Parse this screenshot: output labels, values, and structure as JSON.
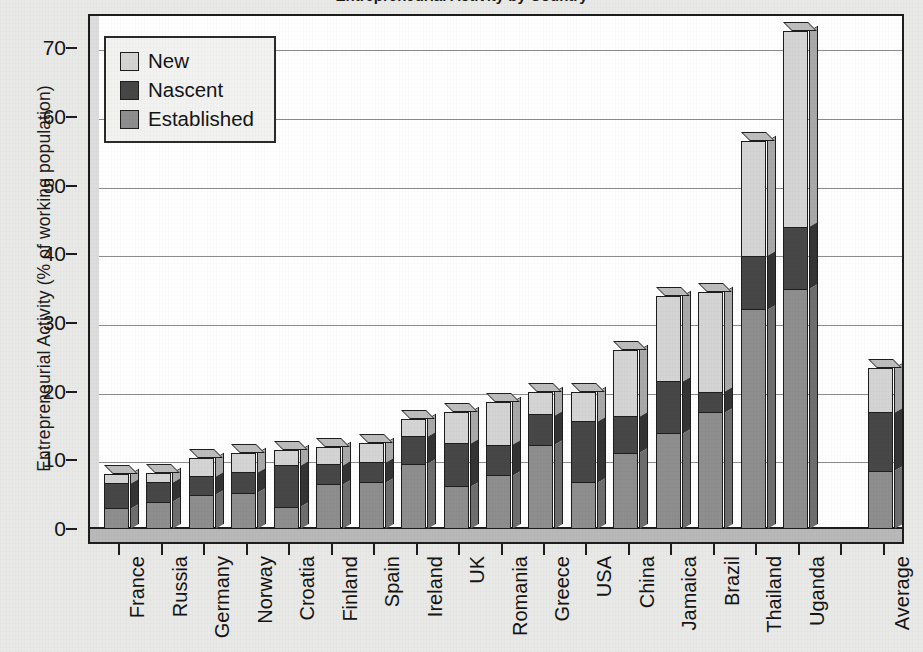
{
  "chart": {
    "title": "Entrepreneurial Activity by Country",
    "y_axis_title": "Entrepreneurial Activity (% of working population)"
  },
  "legend": {
    "items": [
      {
        "label": "New",
        "swatch": "new",
        "color": "#d4d4d4"
      },
      {
        "label": "Nascent",
        "swatch": "nascent",
        "color": "#474747"
      },
      {
        "label": "Established",
        "swatch": "established",
        "color": "#8e8e8e"
      }
    ]
  },
  "y_ticks": [
    "0",
    "10",
    "20",
    "30",
    "40",
    "50",
    "60",
    "70"
  ],
  "chart_data": {
    "type": "bar",
    "title": "Entrepreneurial Activity by Country",
    "subtype": "stacked-3d-column",
    "xlabel": "",
    "ylabel": "Entrepreneurial Activity (% of working population)",
    "ylim": [
      0,
      75
    ],
    "yticks": [
      0,
      10,
      20,
      30,
      40,
      50,
      60,
      70
    ],
    "grid": "horizontal",
    "legend_position": "top-left",
    "categories": [
      "France",
      "Russia",
      "Germany",
      "Norway",
      "Croatia",
      "Finland",
      "Spain",
      "Ireland",
      "UK",
      "Romania",
      "Greece",
      "USA",
      "China",
      "Jamaica",
      "Brazil",
      "Thailand",
      "Uganda",
      "",
      "Average"
    ],
    "series": [
      {
        "name": "Established",
        "color": "#8e8e8e",
        "values": [
          3.0,
          4.0,
          5.0,
          5.3,
          3.2,
          6.5,
          6.8,
          9.5,
          6.2,
          7.8,
          12.3,
          6.8,
          11.0,
          14.0,
          17.0,
          32.0,
          35.0,
          null,
          8.5
        ]
      },
      {
        "name": "Nascent",
        "color": "#474747",
        "values": [
          3.7,
          2.8,
          2.7,
          3.0,
          6.1,
          2.9,
          2.9,
          4.0,
          6.3,
          4.5,
          4.4,
          9.0,
          5.4,
          7.5,
          3.0,
          7.8,
          9.0,
          null,
          8.5
        ]
      },
      {
        "name": "New",
        "color": "#d4d4d4",
        "values": [
          1.3,
          1.4,
          2.6,
          2.8,
          2.2,
          2.6,
          2.8,
          2.5,
          4.5,
          6.2,
          3.3,
          4.2,
          9.6,
          12.5,
          14.5,
          16.7,
          28.5,
          null,
          6.5
        ]
      }
    ],
    "totals": [
      8.0,
      8.2,
      10.3,
      11.1,
      11.5,
      12.0,
      12.5,
      16.0,
      17.0,
      18.5,
      20.0,
      20.0,
      26.0,
      34.0,
      34.5,
      56.5,
      72.5,
      null,
      23.5
    ]
  }
}
